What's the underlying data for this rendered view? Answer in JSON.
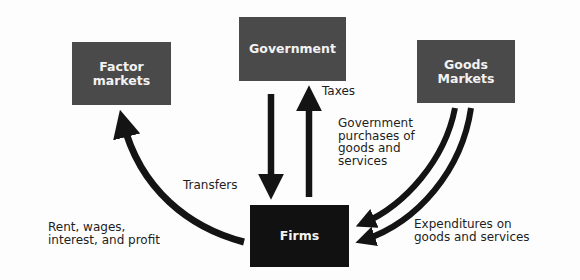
{
  "diagram": {
    "colors": {
      "box_gray": "#4a4a4a",
      "box_dark": "#111111",
      "arrow": "#141414",
      "text": "#1e1e1e",
      "box_text": "#f2f2f2"
    },
    "nodes": {
      "factor_markets": "Factor\nmarkets",
      "government": "Government",
      "goods_markets": "Goods\nMarkets",
      "firms": "Firms"
    },
    "edges": [
      {
        "from": "Firms",
        "to": "Factor markets",
        "label": "Rent, wages,\ninterest, and profit"
      },
      {
        "from": "Government",
        "to": "Firms",
        "label": "Transfers"
      },
      {
        "from": "Firms",
        "to": "Government",
        "label": "Taxes"
      },
      {
        "from": "Goods Markets",
        "to": "Firms",
        "label": "Government\npurchases of\ngoods and\nservices"
      },
      {
        "from": "Goods Markets",
        "to": "Firms",
        "label": "Expenditures on\ngoods and services"
      }
    ]
  }
}
